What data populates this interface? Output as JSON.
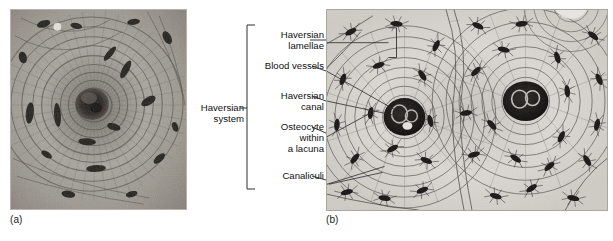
{
  "figure": {
    "panels": [
      {
        "id": "a",
        "caption": "(a)",
        "kind": "photomicrograph",
        "subject": "Haversian system (osteon) in compact bone, transverse section"
      },
      {
        "id": "b",
        "caption": "(b)",
        "kind": "line-drawing",
        "subject": "Diagram of osteons showing Haversian canals, lamellae, osteocytes and canaliculi"
      }
    ]
  },
  "bracket_label": {
    "line1": "Haversian",
    "line2": "system"
  },
  "labels": [
    {
      "key": "haversian_lamellae",
      "line1": "Haversian",
      "line2": "lamellae"
    },
    {
      "key": "blood_vessels",
      "line1": "Blood vessels"
    },
    {
      "key": "haversian_canal",
      "line1": "Haversian",
      "line2": "canal"
    },
    {
      "key": "osteocyte",
      "line1": "Osteocyte",
      "line2": "within",
      "line3": "a lacuna"
    },
    {
      "key": "canaliculi",
      "line1": "Canaliculi"
    }
  ],
  "colors": {
    "text": "#101010",
    "rule": "#333333",
    "panel_a_background": "#9a9691",
    "panel_b_background": "#d9d6d1",
    "ink": "#2b2b2b"
  }
}
